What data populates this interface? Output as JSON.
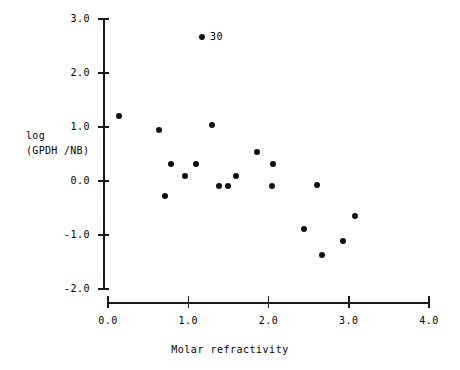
{
  "chart_data": {
    "type": "scatter",
    "title": "",
    "xlabel": "Molar refractivity",
    "ylabel": "log (GPDH /NB)",
    "ylabel_lines": [
      "log",
      "(GPDH /NB)"
    ],
    "xlim": [
      0.0,
      4.0
    ],
    "ylim": [
      -2.0,
      3.0
    ],
    "xticks": [
      "0.0",
      "1.0",
      "2.0",
      "3.0",
      "4.0"
    ],
    "xtick_values": [
      0.0,
      1.0,
      2.0,
      3.0,
      4.0
    ],
    "yticks": [
      "3.0",
      "2.0",
      "1.0",
      "0.0",
      "-1.0",
      "-2.0"
    ],
    "ytick_values": [
      3.0,
      2.0,
      1.0,
      0.0,
      -1.0,
      -2.0
    ],
    "grid": false,
    "legend": false,
    "marker": "filled-circle",
    "marker_color": "#111111",
    "axis_color": "#1a1a1a",
    "points": [
      {
        "x": 0.14,
        "y": 1.21,
        "label": ""
      },
      {
        "x": 0.64,
        "y": 0.94,
        "label": ""
      },
      {
        "x": 0.71,
        "y": -0.27,
        "label": ""
      },
      {
        "x": 0.79,
        "y": 0.32,
        "label": ""
      },
      {
        "x": 0.96,
        "y": 0.1,
        "label": ""
      },
      {
        "x": 1.1,
        "y": 0.32,
        "label": ""
      },
      {
        "x": 1.17,
        "y": 2.67,
        "label": "30"
      },
      {
        "x": 1.3,
        "y": 1.03,
        "label": ""
      },
      {
        "x": 1.38,
        "y": -0.09,
        "label": ""
      },
      {
        "x": 1.5,
        "y": -0.09,
        "label": ""
      },
      {
        "x": 1.6,
        "y": 0.1,
        "label": ""
      },
      {
        "x": 1.86,
        "y": 0.53,
        "label": ""
      },
      {
        "x": 2.04,
        "y": -0.09,
        "label": ""
      },
      {
        "x": 2.06,
        "y": 0.32,
        "label": ""
      },
      {
        "x": 2.44,
        "y": -0.89,
        "label": ""
      },
      {
        "x": 2.6,
        "y": -0.07,
        "label": ""
      },
      {
        "x": 2.67,
        "y": -1.37,
        "label": ""
      },
      {
        "x": 2.93,
        "y": -1.11,
        "label": ""
      },
      {
        "x": 3.08,
        "y": -0.64,
        "label": ""
      }
    ]
  }
}
